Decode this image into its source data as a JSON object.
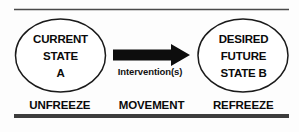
{
  "diagram": {
    "background_color": "#fdfdfd",
    "ink_color": "#0a0a0a",
    "rule_color": "#3d3d3d",
    "nodes": {
      "current_state": {
        "line1": "CURRENT",
        "line2": "STATE",
        "line3": "A"
      },
      "desired_state": {
        "line1": "DESIRED",
        "line2": "FUTURE",
        "line3": "STATE B"
      }
    },
    "connector": {
      "arrow_icon": "arrow-right-icon",
      "label": "Intervention(s)"
    },
    "phases": [
      {
        "label": "UNFREEZE"
      },
      {
        "label": "MOVEMENT"
      },
      {
        "label": "REFREEZE"
      }
    ]
  }
}
